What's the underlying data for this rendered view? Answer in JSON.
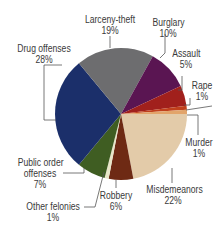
{
  "chart_data": {
    "type": "pie",
    "title": "",
    "start_angle_deg": 0,
    "direction": "clockwise",
    "slices": [
      {
        "label": "Misdemeanors",
        "value": 22,
        "pct_label": "22%",
        "color": "#e3cba9"
      },
      {
        "label": "Robbery",
        "value": 6,
        "pct_label": "6%",
        "color": "#6e2a14"
      },
      {
        "label": "Other felonies",
        "value": 1,
        "pct_label": "1%",
        "color": "#e8e6c8"
      },
      {
        "label": "Public order offenses",
        "value": 7,
        "pct_label": "7%",
        "color": "#3f5d22"
      },
      {
        "label": "Drug offenses",
        "value": 28,
        "pct_label": "28%",
        "color": "#1b2f6a"
      },
      {
        "label": "Larceny-theft",
        "value": 19,
        "pct_label": "19%",
        "color": "#6d6d6f"
      },
      {
        "label": "Burglary",
        "value": 10,
        "pct_label": "10%",
        "color": "#5a1552"
      },
      {
        "label": "Assault",
        "value": 5,
        "pct_label": "5%",
        "color": "#a1201c"
      },
      {
        "label": "Rape",
        "value": 1,
        "pct_label": "1%",
        "color": "#c0401c"
      },
      {
        "label": "Murder",
        "value": 1,
        "pct_label": "1%",
        "color": "#e2a46a"
      }
    ],
    "legend": "none (leader-line labels)"
  },
  "labels": {
    "larceny": {
      "name": "Larceny-theft",
      "pct": "19%"
    },
    "burglary": {
      "name": "Burglary",
      "pct": "10%"
    },
    "assault": {
      "name": "Assault",
      "pct": "5%"
    },
    "rape": {
      "name": "Rape",
      "pct": "1%"
    },
    "murder": {
      "name": "Murder",
      "pct": "1%"
    },
    "misdemeanors": {
      "name": "Misdemeanors",
      "pct": "22%"
    },
    "robbery": {
      "name": "Robbery",
      "pct": "6%"
    },
    "other": {
      "name": "Other felonies",
      "pct": "1%"
    },
    "publicorder": {
      "name1": "Public order",
      "name2": "offenses",
      "pct": "7%"
    },
    "drug": {
      "name": "Drug offenses",
      "pct": "28%"
    }
  }
}
